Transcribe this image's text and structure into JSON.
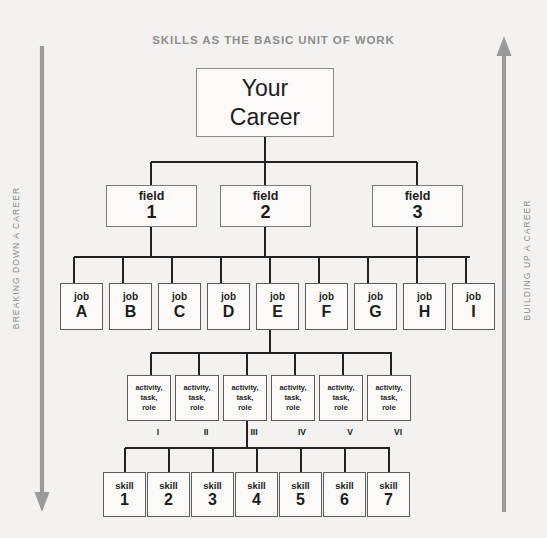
{
  "diagram": {
    "title": "SKILLS AS THE BASIC UNIT OF WORK",
    "background_color": "#f3f2f0",
    "line_color": "#222222",
    "title_color": "#8d8d8d",
    "arrow_color": "#9a9a9a"
  },
  "left_axis": {
    "label": "BREAKING DOWN A CAREER",
    "direction": "down",
    "icon": "arrow-down-icon"
  },
  "right_axis": {
    "label": "BUILDING UP A CAREER",
    "direction": "up",
    "icon": "arrow-up-icon"
  },
  "levels": {
    "root": {
      "line1": "Your",
      "line2": "Career"
    },
    "fields": {
      "caption": "field",
      "items": [
        {
          "caption": "field",
          "value": "1"
        },
        {
          "caption": "field",
          "value": "2"
        },
        {
          "caption": "field",
          "value": "3"
        }
      ]
    },
    "jobs": {
      "caption": "job",
      "items": [
        {
          "caption": "job",
          "value": "A"
        },
        {
          "caption": "job",
          "value": "B"
        },
        {
          "caption": "job",
          "value": "C"
        },
        {
          "caption": "job",
          "value": "D"
        },
        {
          "caption": "job",
          "value": "E"
        },
        {
          "caption": "job",
          "value": "F"
        },
        {
          "caption": "job",
          "value": "G"
        },
        {
          "caption": "job",
          "value": "H"
        },
        {
          "caption": "job",
          "value": "I"
        }
      ]
    },
    "activities": {
      "line1": "activity,",
      "line2": "task,",
      "line3": "role",
      "items": [
        {
          "line1": "activity,",
          "line2": "task,",
          "line3": "role",
          "numeral": "I"
        },
        {
          "line1": "activity,",
          "line2": "task,",
          "line3": "role",
          "numeral": "II"
        },
        {
          "line1": "activity,",
          "line2": "task,",
          "line3": "role",
          "numeral": "III"
        },
        {
          "line1": "activity,",
          "line2": "task,",
          "line3": "role",
          "numeral": "IV"
        },
        {
          "line1": "activity,",
          "line2": "task,",
          "line3": "role",
          "numeral": "V"
        },
        {
          "line1": "activity,",
          "line2": "task,",
          "line3": "role",
          "numeral": "VI"
        }
      ]
    },
    "skills": {
      "caption": "skill",
      "items": [
        {
          "caption": "skill",
          "value": "1"
        },
        {
          "caption": "skill",
          "value": "2"
        },
        {
          "caption": "skill",
          "value": "3"
        },
        {
          "caption": "skill",
          "value": "4"
        },
        {
          "caption": "skill",
          "value": "5"
        },
        {
          "caption": "skill",
          "value": "6"
        },
        {
          "caption": "skill",
          "value": "7"
        }
      ]
    }
  }
}
